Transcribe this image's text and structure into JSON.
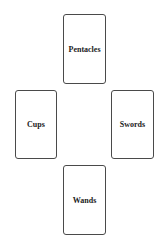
{
  "cards": [
    {
      "position": "top",
      "label": "Pentacles"
    },
    {
      "position": "left",
      "label": "Cups"
    },
    {
      "position": "right",
      "label": "Swords"
    },
    {
      "position": "bottom",
      "label": "Wands"
    }
  ]
}
